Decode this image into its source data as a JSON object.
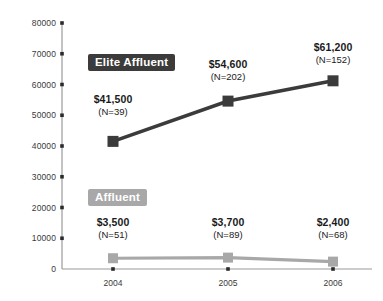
{
  "chart_data": {
    "type": "line",
    "title": "",
    "xlabel": "",
    "ylabel": "",
    "categories": [
      "2004",
      "2005",
      "2006"
    ],
    "ylim": [
      0,
      80000
    ],
    "ytick_labels": [
      "0",
      "10000",
      "20000",
      "30000",
      "40000",
      "50000",
      "60000",
      "70000",
      "80000"
    ],
    "ytick_values": [
      0,
      10000,
      20000,
      30000,
      40000,
      50000,
      60000,
      70000,
      80000
    ],
    "grid": false,
    "legend": "inline-badges",
    "series": [
      {
        "name": "Elite Affluent",
        "color": "#3b3b3b",
        "values": [
          41500,
          54600,
          61200
        ],
        "counts": [
          39,
          202,
          152
        ],
        "labels": [
          {
            "value": "$41,500",
            "n": "(N=39)"
          },
          {
            "value": "$54,600",
            "n": "(N=202)"
          },
          {
            "value": "$61,200",
            "n": "(N=152)"
          }
        ]
      },
      {
        "name": "Affluent",
        "color": "#a8a8a8",
        "values": [
          3500,
          3700,
          2400
        ],
        "counts": [
          51,
          89,
          68
        ],
        "labels": [
          {
            "value": "$3,500",
            "n": "(N=51)"
          },
          {
            "value": "$3,700",
            "n": "(N=89)"
          },
          {
            "value": "$2,400",
            "n": "(N=68)"
          }
        ]
      }
    ]
  },
  "colors": {
    "background": "#ffffff",
    "axis": "#8a8a8a",
    "tick_text": "#3a3a3a",
    "elite": "#3b3b3b",
    "affluent": "#a8a8a8"
  }
}
